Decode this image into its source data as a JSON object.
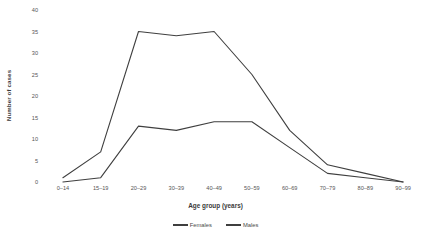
{
  "chart_data": {
    "type": "line",
    "title": "",
    "xlabel": "Age group (years)",
    "ylabel": "Number of cases",
    "categories": [
      "0–14",
      "15–19",
      "20–29",
      "30–39",
      "40–49",
      "50–59",
      "60–69",
      "70–79",
      "80–89",
      "90–99"
    ],
    "yticks": [
      "40",
      "35",
      "30",
      "25",
      "20",
      "15",
      "10",
      "5",
      "0"
    ],
    "ylim": [
      0,
      40
    ],
    "grid": false,
    "legend_position": "bottom",
    "series": [
      {
        "name": "Females",
        "values": [
          1,
          7,
          35,
          34,
          35,
          25,
          12,
          4,
          2,
          0
        ],
        "color": "#3f3f3f"
      },
      {
        "name": "Males",
        "values": [
          0,
          1,
          13,
          12,
          14,
          14,
          8,
          2,
          1,
          0
        ],
        "color": "#3f3f3f"
      }
    ]
  }
}
